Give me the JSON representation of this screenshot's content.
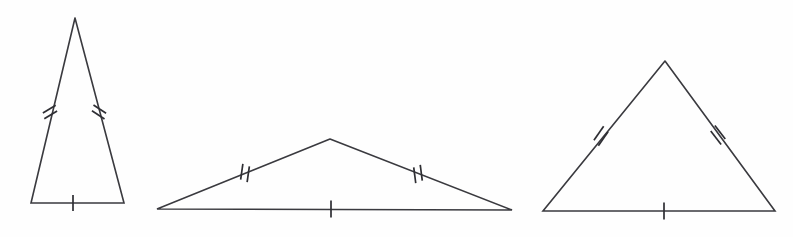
{
  "figure": {
    "background_color": "#fefefe",
    "stroke_color": "#3a3a3f",
    "tick_color": "#2e2e33",
    "canvas": {
      "width": 793,
      "height": 237
    },
    "triangle_count": 3,
    "triangles": [
      {
        "name": "tall-narrow-isosceles-triangle",
        "label": "Triangle 1",
        "shape": "tall narrow isosceles",
        "vertices": {
          "apex": [
            75,
            18
          ],
          "base_left": [
            31,
            203
          ],
          "base_right": [
            124,
            203
          ]
        },
        "points": "75,18 31,203 124,203 75,18",
        "edges": [
          {
            "name": "left-leg",
            "from": [
              75,
              18
            ],
            "to": [
              31,
              203
            ],
            "ticks": 2
          },
          {
            "name": "right-leg",
            "from": [
              75,
              18
            ],
            "to": [
              124,
              203
            ],
            "ticks": 2
          },
          {
            "name": "base",
            "from": [
              31,
              203
            ],
            "to": [
              124,
              203
            ],
            "ticks": 1
          }
        ],
        "tick_groups": [
          {
            "name": "left-leg-double-tick",
            "cx": 50,
            "cy": 112,
            "count": 2,
            "angle_deg": 76.6,
            "length": 15,
            "spacing": 6,
            "slant_deg": -18
          },
          {
            "name": "right-leg-double-tick",
            "cx": 99,
            "cy": 112,
            "count": 2,
            "angle_deg": -75.1,
            "length": 15,
            "spacing": 6,
            "slant_deg": 18
          },
          {
            "name": "base-single-tick",
            "cx": 73,
            "cy": 203,
            "count": 1,
            "angle_deg": 0,
            "length": 16,
            "spacing": 0,
            "slant_deg": 0
          }
        ]
      },
      {
        "name": "wide-obtuse-isosceles-triangle",
        "label": "Triangle 2",
        "shape": "wide flat obtuse isosceles",
        "vertices": {
          "apex": [
            330,
            139
          ],
          "base_left": [
            157,
            209
          ],
          "base_right": [
            512,
            210
          ]
        },
        "points": "330,139 157,209 512,210 330,139",
        "edges": [
          {
            "name": "left-leg",
            "from": [
              330,
              139
            ],
            "to": [
              157,
              209
            ],
            "ticks": 2
          },
          {
            "name": "right-leg",
            "from": [
              330,
              139
            ],
            "to": [
              512,
              210
            ],
            "ticks": 2
          },
          {
            "name": "base",
            "from": [
              157,
              209
            ],
            "to": [
              512,
              210
            ],
            "ticks": 1
          }
        ],
        "tick_groups": [
          {
            "name": "left-leg-double-tick",
            "cx": 245,
            "cy": 173,
            "count": 2,
            "angle_deg": 22.0,
            "length": 16,
            "spacing": 7,
            "slant_deg": -14
          },
          {
            "name": "right-leg-double-tick",
            "cx": 418,
            "cy": 174,
            "count": 2,
            "angle_deg": -21.3,
            "length": 16,
            "spacing": 7,
            "slant_deg": 14
          },
          {
            "name": "base-single-tick",
            "cx": 331,
            "cy": 209,
            "count": 1,
            "angle_deg": 0,
            "length": 17,
            "spacing": 0,
            "slant_deg": 0
          }
        ]
      },
      {
        "name": "near-equilateral-isosceles-triangle",
        "label": "Triangle 3",
        "shape": "near-equilateral isosceles",
        "vertices": {
          "apex": [
            665,
            61
          ],
          "base_left": [
            543,
            211
          ],
          "base_right": [
            775,
            211
          ]
        },
        "points": "665,61 543,211 775,211 665,61",
        "edges": [
          {
            "name": "left-leg",
            "from": [
              665,
              61
            ],
            "to": [
              543,
              211
            ],
            "ticks": 2
          },
          {
            "name": "right-leg",
            "from": [
              665,
              61
            ],
            "to": [
              775,
              211
            ],
            "ticks": 2
          },
          {
            "name": "base",
            "from": [
              543,
              211
            ],
            "to": [
              775,
              211
            ],
            "ticks": 1
          }
        ],
        "tick_groups": [
          {
            "name": "left-leg-double-tick",
            "cx": 601,
            "cy": 136,
            "count": 2,
            "angle_deg": 50.9,
            "length": 17,
            "spacing": 7,
            "slant_deg": -16
          },
          {
            "name": "right-leg-double-tick",
            "cx": 718,
            "cy": 135,
            "count": 2,
            "angle_deg": -53.7,
            "length": 17,
            "spacing": 7,
            "slant_deg": 16
          },
          {
            "name": "base-single-tick",
            "cx": 664,
            "cy": 211,
            "count": 1,
            "angle_deg": 0,
            "length": 17,
            "spacing": 0,
            "slant_deg": 0
          }
        ]
      }
    ]
  }
}
